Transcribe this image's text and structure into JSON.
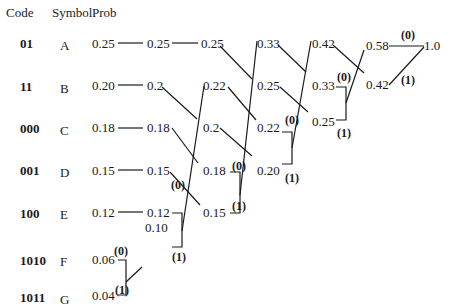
{
  "headers": {
    "code": "Code",
    "symbol": "Symbol",
    "prob": "Prob"
  },
  "rows": [
    {
      "code": "01",
      "symbol": "A",
      "prob": "0.25"
    },
    {
      "code": "11",
      "symbol": "B",
      "prob": "0.20"
    },
    {
      "code": "000",
      "symbol": "C",
      "prob": "0.18"
    },
    {
      "code": "001",
      "symbol": "D",
      "prob": "0.15"
    },
    {
      "code": "100",
      "symbol": "E",
      "prob": "0.12"
    },
    {
      "code": "1010",
      "symbol": "F",
      "prob": "0.06"
    },
    {
      "code": "1011",
      "symbol": "G",
      "prob": "0.04"
    }
  ],
  "stages": [
    {
      "values": [
        "0.25",
        "0.2",
        "0.18",
        "0.15",
        "0.12",
        "0.10"
      ]
    },
    {
      "values": [
        "0.25",
        "0.22",
        "0.2",
        "0.18",
        "0.15"
      ]
    },
    {
      "values": [
        "0.33",
        "0.25",
        "0.22",
        "0.20"
      ]
    },
    {
      "values": [
        "0.42",
        "0.33",
        "0.25"
      ]
    },
    {
      "values": [
        "0.58",
        "0.42"
      ]
    },
    {
      "values": [
        "1.0"
      ]
    }
  ],
  "bits": {
    "zero": "(0)",
    "one": "(1)"
  }
}
